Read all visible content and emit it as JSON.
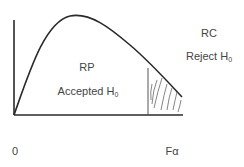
{
  "diagram": {
    "type": "F-distribution hypothesis test regions",
    "regions": {
      "acceptance": {
        "abbrev": "RP",
        "label_main": "Accepted H",
        "label_sub": "0"
      },
      "rejection": {
        "abbrev": "RC",
        "label_main": "Reject H",
        "label_sub": "0"
      }
    },
    "axis": {
      "origin_label": "0",
      "critical_label": "Fα"
    },
    "colors": {
      "line": "#2a2a2a",
      "text": "#444444",
      "hatch": "#555555",
      "background": "#ffffff"
    }
  }
}
